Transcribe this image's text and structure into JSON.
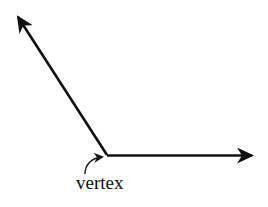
{
  "diagram": {
    "label": "vertex",
    "colors": {
      "stroke": "#111111",
      "background": "#ffffff"
    },
    "elements": {
      "vertex_point": {
        "x": 107,
        "y": 155
      },
      "ray_upper": {
        "tip": {
          "x": 16,
          "y": 14
        }
      },
      "ray_right": {
        "tip": {
          "x": 253,
          "y": 156
        }
      }
    }
  }
}
